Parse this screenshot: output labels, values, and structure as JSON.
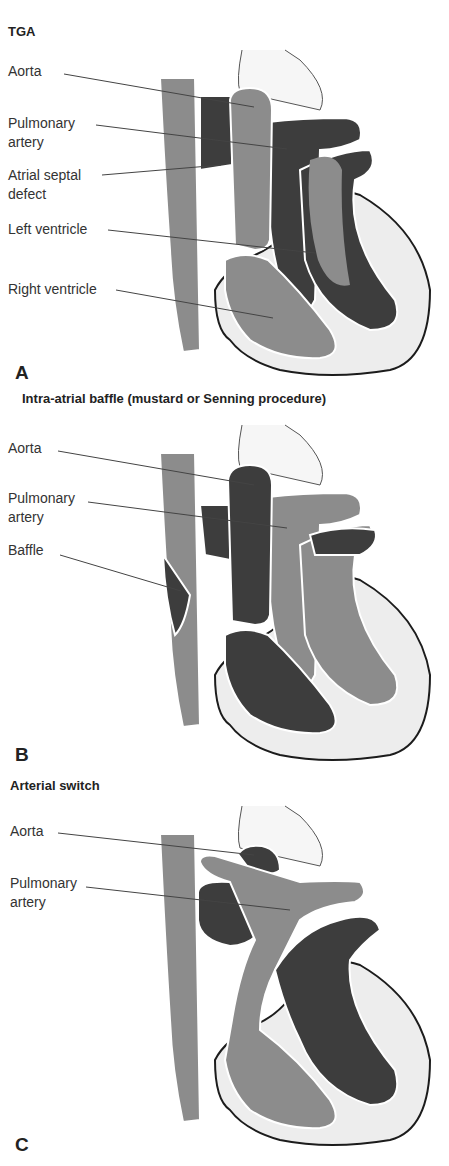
{
  "colors": {
    "oxygenated": "#8c8c8c",
    "deoxygenated": "#3d3d3d",
    "myocardium": "#ededed",
    "outline": "#1c1c1c",
    "leader": "#444444"
  },
  "panels": [
    {
      "letter": "A",
      "title": "TGA",
      "labels": [
        {
          "text": "Aorta"
        },
        {
          "text": "Pulmonary\nartery"
        },
        {
          "text": "Atrial septal\ndefect"
        },
        {
          "text": "Left ventricle"
        },
        {
          "text": "Right ventricle"
        }
      ]
    },
    {
      "letter": "B",
      "title": "Intra-atrial baffle (mustard or Senning procedure)",
      "labels": [
        {
          "text": "Aorta"
        },
        {
          "text": "Pulmonary\nartery"
        },
        {
          "text": "Baffle"
        }
      ]
    },
    {
      "letter": "C",
      "title": "Arterial switch",
      "labels": [
        {
          "text": "Aorta"
        },
        {
          "text": "Pulmonary\nartery"
        }
      ]
    }
  ]
}
